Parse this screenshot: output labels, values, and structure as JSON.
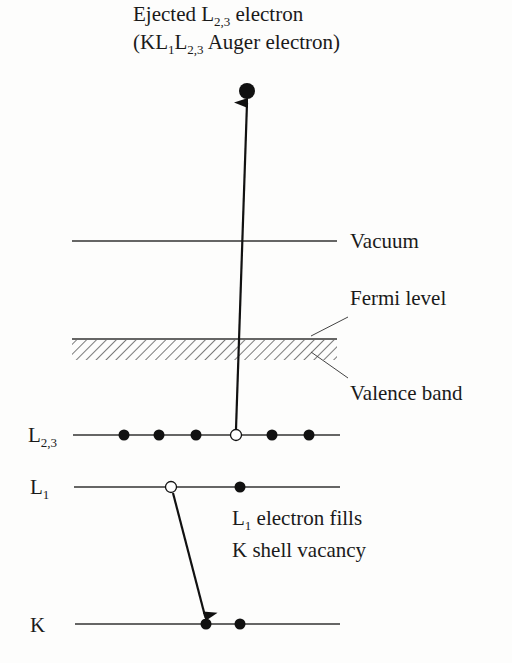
{
  "title": {
    "line1": {
      "prefix": "Ejected L",
      "sub": "2,3",
      "suffix": " electron"
    },
    "line2": {
      "open": "(KL",
      "sub1": "1",
      "mid": "L",
      "sub2": "2,3",
      "suffix": " Auger electron)"
    }
  },
  "levels": [
    {
      "id": "vacuum",
      "label": "Vacuum",
      "y": 241
    },
    {
      "id": "fermi",
      "label": "Fermi level",
      "y": 339
    },
    {
      "id": "valence",
      "label": "Valence band"
    },
    {
      "id": "L23",
      "label_main": "L",
      "label_sub": "2,3",
      "y": 435,
      "electrons": [
        124,
        159,
        196,
        272,
        309
      ],
      "vacancies": [
        236
      ]
    },
    {
      "id": "L1",
      "label_main": "L",
      "label_sub": "1",
      "y": 487,
      "electrons": [
        240
      ],
      "vacancies": [
        171
      ]
    },
    {
      "id": "K",
      "label_main": "K",
      "y": 624,
      "electrons": [
        206,
        240
      ]
    }
  ],
  "annotation": {
    "line1": {
      "main": "L",
      "sub": "1",
      "suffix": " electron fills"
    },
    "line2": "K shell vacancy"
  },
  "colors": {
    "ink": "#1a1a1a",
    "line": "#333333",
    "background": "#fdfdfc"
  }
}
